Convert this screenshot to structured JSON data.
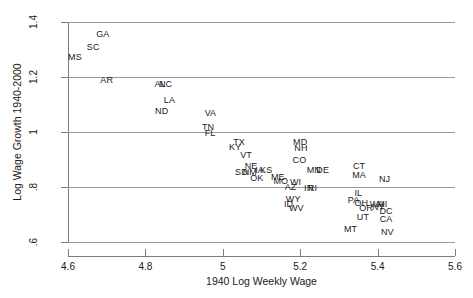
{
  "chart_data": {
    "type": "scatter",
    "title": "",
    "xlabel": "1940 Log Weekly Wage",
    "ylabel": "Log Wage Growth 1940-2000",
    "xlim": [
      4.6,
      5.6
    ],
    "ylim": [
      0.6,
      1.4
    ],
    "xticks": [
      "4.6",
      "4.8",
      "5",
      "5.2",
      "5.4",
      "5.6"
    ],
    "xtick_values": [
      4.6,
      4.8,
      5.0,
      5.2,
      5.4,
      5.6
    ],
    "yticks": [
      ".6",
      ".8",
      "1",
      "1.2",
      "1.4"
    ],
    "ytick_values": [
      0.6,
      0.8,
      1.0,
      1.2,
      1.4
    ],
    "grid": "horizontal",
    "legend": "none",
    "marker_style": "text-label",
    "note": "Each data point is drawn as a two-letter US state abbreviation rather than a marker symbol.",
    "points": [
      {
        "label": "GA",
        "x": 4.69,
        "y": 1.355
      },
      {
        "label": "SC",
        "x": 4.665,
        "y": 1.31
      },
      {
        "label": "MS",
        "x": 4.618,
        "y": 1.272
      },
      {
        "label": "AR",
        "x": 4.7,
        "y": 1.188
      },
      {
        "label": "AL",
        "x": 4.838,
        "y": 1.175
      },
      {
        "label": "NC",
        "x": 4.852,
        "y": 1.175
      },
      {
        "label": "LA",
        "x": 4.862,
        "y": 1.118
      },
      {
        "label": "ND",
        "x": 4.842,
        "y": 1.075
      },
      {
        "label": "VA",
        "x": 4.968,
        "y": 1.068
      },
      {
        "label": "TN",
        "x": 4.962,
        "y": 1.018
      },
      {
        "label": "FL",
        "x": 4.967,
        "y": 0.995
      },
      {
        "label": "TX",
        "x": 5.042,
        "y": 0.962
      },
      {
        "label": "MD",
        "x": 5.2,
        "y": 0.963
      },
      {
        "label": "KY",
        "x": 5.032,
        "y": 0.945
      },
      {
        "label": "NH",
        "x": 5.202,
        "y": 0.942
      },
      {
        "label": "VT",
        "x": 5.06,
        "y": 0.918
      },
      {
        "label": "CO",
        "x": 5.198,
        "y": 0.898
      },
      {
        "label": "NE",
        "x": 5.073,
        "y": 0.878
      },
      {
        "label": "CT",
        "x": 5.352,
        "y": 0.878
      },
      {
        "label": "IA",
        "x": 5.095,
        "y": 0.862
      },
      {
        "label": "KS",
        "x": 5.112,
        "y": 0.862
      },
      {
        "label": "MN",
        "x": 5.235,
        "y": 0.862
      },
      {
        "label": "DE",
        "x": 5.258,
        "y": 0.862
      },
      {
        "label": "SD",
        "x": 5.048,
        "y": 0.855
      },
      {
        "label": "NM",
        "x": 5.07,
        "y": 0.855
      },
      {
        "label": "MA",
        "x": 5.352,
        "y": 0.842
      },
      {
        "label": "ME",
        "x": 5.142,
        "y": 0.838
      },
      {
        "label": "OK",
        "x": 5.088,
        "y": 0.832
      },
      {
        "label": "NJ",
        "x": 5.418,
        "y": 0.83
      },
      {
        "label": "MO",
        "x": 5.15,
        "y": 0.822
      },
      {
        "label": "WI",
        "x": 5.188,
        "y": 0.818
      },
      {
        "label": "AZ",
        "x": 5.175,
        "y": 0.8
      },
      {
        "label": "IN",
        "x": 5.222,
        "y": 0.798
      },
      {
        "label": "RI",
        "x": 5.232,
        "y": 0.798
      },
      {
        "label": "IL",
        "x": 5.35,
        "y": 0.778
      },
      {
        "label": "WY",
        "x": 5.182,
        "y": 0.758
      },
      {
        "label": "PA",
        "x": 5.338,
        "y": 0.752
      },
      {
        "label": "OH",
        "x": 5.358,
        "y": 0.742
      },
      {
        "label": "WA",
        "x": 5.398,
        "y": 0.74
      },
      {
        "label": "MI",
        "x": 5.412,
        "y": 0.738
      },
      {
        "label": "ID",
        "x": 5.17,
        "y": 0.738
      },
      {
        "label": "NY",
        "x": 5.402,
        "y": 0.728
      },
      {
        "label": "WV",
        "x": 5.19,
        "y": 0.722
      },
      {
        "label": "OR",
        "x": 5.37,
        "y": 0.722
      },
      {
        "label": "DC",
        "x": 5.422,
        "y": 0.712
      },
      {
        "label": "UT",
        "x": 5.362,
        "y": 0.69
      },
      {
        "label": "CA",
        "x": 5.422,
        "y": 0.682
      },
      {
        "label": "MT",
        "x": 5.33,
        "y": 0.648
      },
      {
        "label": "NV",
        "x": 5.425,
        "y": 0.638
      }
    ]
  }
}
